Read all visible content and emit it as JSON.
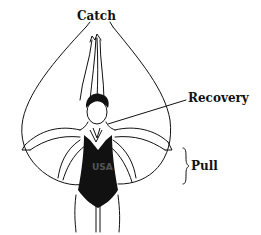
{
  "diagram": {
    "labels": {
      "catch": "Catch",
      "recovery": "Recovery",
      "pull": "Pull"
    },
    "suit_text": "USA",
    "colors": {
      "ink": "#111111",
      "background": "#ffffff"
    }
  }
}
